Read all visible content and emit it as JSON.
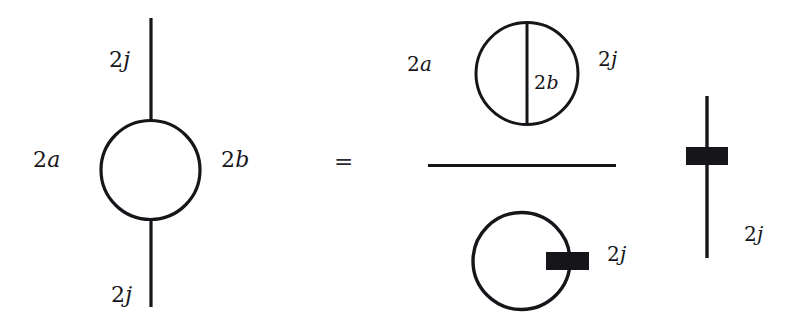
{
  "figure": {
    "type": "spin-network-diagram",
    "ink_color": "#16161a",
    "background_color": "#ffffff",
    "relation_symbol": "=",
    "left_hand_side": {
      "name": "bubble-diagram",
      "strand_top_label": "2j",
      "strand_bottom_label": "2j",
      "loop_left_label": "2a",
      "loop_right_label": "2b"
    },
    "right_hand_side": {
      "name": "fraction",
      "numerator": {
        "name": "theta-net",
        "left_label": "2a",
        "chord_label": "2b",
        "right_label": "2j"
      },
      "denominator": {
        "name": "loop-with-box",
        "label": "2j"
      }
    },
    "trailing_factor": {
      "name": "strand-with-box",
      "label": "2j"
    }
  }
}
